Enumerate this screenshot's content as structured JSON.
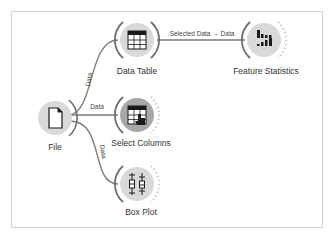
{
  "workflow": {
    "nodes": [
      {
        "id": "file",
        "label": "File",
        "icon": "file-icon",
        "has_input": false,
        "has_output": true
      },
      {
        "id": "data-table",
        "label": "Data Table",
        "icon": "table-icon",
        "has_input": true,
        "has_output": true
      },
      {
        "id": "select-columns",
        "label": "Select Columns",
        "icon": "select-columns-icon",
        "has_input": true,
        "has_output": true
      },
      {
        "id": "box-plot",
        "label": "Box Plot",
        "icon": "box-plot-icon",
        "has_input": true,
        "has_output": true
      },
      {
        "id": "feature-statistics",
        "label": "Feature Statistics",
        "icon": "feature-statistics-icon",
        "has_input": true,
        "has_output": true
      }
    ],
    "links": [
      {
        "from": "file",
        "to": "data-table",
        "label": "Data"
      },
      {
        "from": "file",
        "to": "select-columns",
        "label": "Data"
      },
      {
        "from": "file",
        "to": "box-plot",
        "label": "Data"
      },
      {
        "from": "data-table",
        "to": "feature-statistics",
        "label": "Selected Data → Data"
      }
    ]
  },
  "colors": {
    "node_fill": "#d9d9d9",
    "node_fill_dark": "#a8a8a8",
    "link": "#7a7a7a",
    "frame": "#d4d4d4",
    "icon": "#1a1a1a"
  }
}
